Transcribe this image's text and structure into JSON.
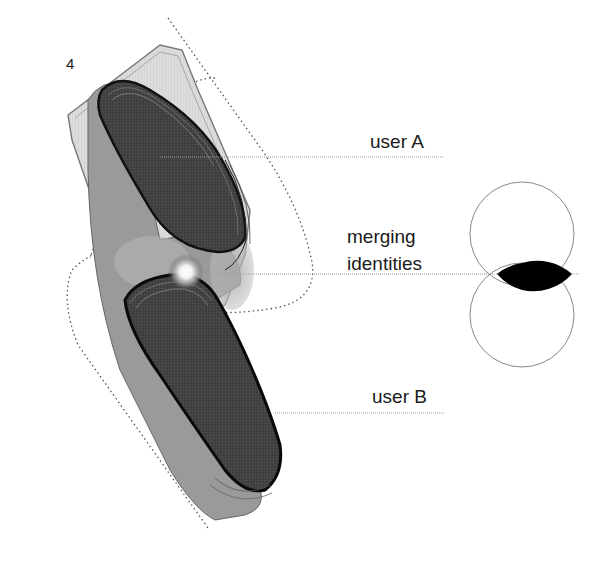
{
  "figure": {
    "number": "4",
    "labels": {
      "user_a": "user A",
      "merging_line1": "merging",
      "merging_line2": "identities",
      "user_b": "user B"
    },
    "colors": {
      "background": "#ffffff",
      "dark_shape": "#3a3a3a",
      "mid_shape": "#8c8c8c",
      "light_shape": "#d6d6d6",
      "outline": "#555555",
      "leader_line": "#9a9a9a",
      "venn_stroke": "#888888",
      "venn_intersection": "#000000"
    },
    "venn": {
      "top_circle": {
        "cx": 522,
        "cy": 234,
        "r": 52
      },
      "bottom_circle": {
        "cx": 522,
        "cy": 315,
        "r": 52
      },
      "intersection": "filled-black"
    }
  }
}
